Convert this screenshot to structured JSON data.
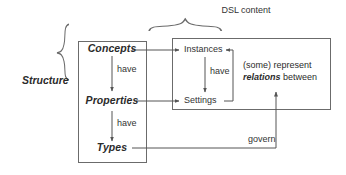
{
  "diagram": {
    "colors": {
      "stroke": "#6b6b6b",
      "text": "#2b2b2b",
      "background": "#ffffff"
    },
    "groups": {
      "structure": {
        "label": "Structure",
        "brace": "left-curly-brace"
      },
      "dsl_content": {
        "label": "DSL content",
        "brace": "top-curly-brace"
      }
    },
    "boxes": {
      "structure_box": {
        "name": "structure-box",
        "nodes": [
          {
            "id": "concepts",
            "label": "Concepts"
          },
          {
            "id": "properties",
            "label": "Properties"
          },
          {
            "id": "types",
            "label": "Types"
          }
        ]
      },
      "content_box": {
        "name": "dsl-content-box",
        "nodes": [
          {
            "id": "instances",
            "label": "Instances"
          },
          {
            "id": "settings",
            "label": "Settings"
          }
        ]
      }
    },
    "edges": [
      {
        "id": "concepts-have-properties",
        "label": "have",
        "from": "concepts",
        "to": "properties"
      },
      {
        "id": "properties-have-types",
        "label": "have",
        "from": "properties",
        "to": "types"
      },
      {
        "id": "instances-have-settings",
        "label": "have",
        "from": "instances",
        "to": "settings"
      },
      {
        "id": "concepts-to-instances",
        "label": "",
        "from": "concepts",
        "to": "instances"
      },
      {
        "id": "properties-to-settings",
        "label": "",
        "from": "properties",
        "to": "settings"
      },
      {
        "id": "settings-to-instances",
        "label": "",
        "from": "settings",
        "to": "instances"
      },
      {
        "id": "types-govern",
        "label": "govern",
        "from": "types",
        "to": "relations-note"
      }
    ],
    "notes": {
      "relations": {
        "line1": "(some) represent",
        "emphasis": "relations",
        "line2_tail": " between"
      }
    }
  }
}
